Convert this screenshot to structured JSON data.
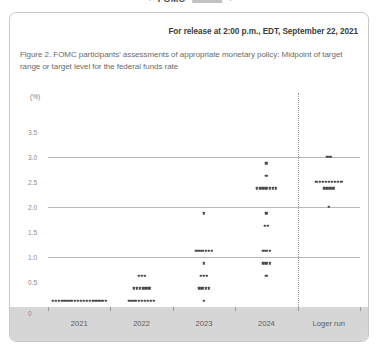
{
  "chrome": {
    "back_arrow": "‹",
    "forward_arrow": "›",
    "title": "FOMC"
  },
  "document": {
    "release_line": "For release at 2:00 p.m., EDT, September 22, 2021",
    "caption": "Figure 2. FOMC participants' assessments of appropriate monetary policy: Midpoint of target range or target level for the federal funds rate"
  },
  "chart_data": {
    "type": "scatter",
    "title": "Figure 2. FOMC participants' assessments of appropriate monetary policy: Midpoint of target range or target level for the federal funds rate",
    "xlabel": "",
    "ylabel": "(%)",
    "unit_label": "(%)",
    "ylim": [
      0,
      4.0
    ],
    "yticks": [
      "3.5",
      "3.0",
      "2.5",
      "2.0",
      "1.5",
      "1.0",
      "0.5",
      "0"
    ],
    "ytick_values": [
      3.5,
      3.0,
      2.5,
      2.0,
      1.5,
      1.0,
      0.5,
      0
    ],
    "gridlines_at": [
      3.0,
      2.0,
      1.0
    ],
    "grid": true,
    "legend": "none",
    "categories": [
      "2021",
      "2022",
      "2023",
      "2024",
      "Loger run"
    ],
    "divider_after_category": "2024",
    "series": [
      {
        "name": "2021",
        "clusters": [
          {
            "rate": 0.125,
            "count": 18
          }
        ]
      },
      {
        "name": "2022",
        "clusters": [
          {
            "rate": 0.625,
            "count": 3
          },
          {
            "rate": 0.375,
            "count": 6
          },
          {
            "rate": 0.125,
            "count": 9
          }
        ]
      },
      {
        "name": "2023",
        "clusters": [
          {
            "rate": 1.875,
            "count": 1
          },
          {
            "rate": 1.125,
            "count": 6
          },
          {
            "rate": 0.875,
            "count": 1
          },
          {
            "rate": 0.625,
            "count": 3
          },
          {
            "rate": 0.375,
            "count": 4
          },
          {
            "rate": 0.125,
            "count": 1
          }
        ]
      },
      {
        "name": "2024",
        "clusters": [
          {
            "rate": 2.875,
            "count": 1
          },
          {
            "rate": 2.625,
            "count": 1
          },
          {
            "rate": 2.375,
            "count": 7
          },
          {
            "rate": 1.875,
            "count": 1
          },
          {
            "rate": 1.625,
            "count": 2
          },
          {
            "rate": 1.125,
            "count": 3
          },
          {
            "rate": 0.875,
            "count": 3
          },
          {
            "rate": 0.625,
            "count": 1
          }
        ]
      },
      {
        "name": "Loger run",
        "clusters": [
          {
            "rate": 3.0,
            "count": 2
          },
          {
            "rate": 2.5,
            "count": 9
          },
          {
            "rate": 2.375,
            "count": 4
          },
          {
            "rate": 2.0,
            "count": 1
          }
        ]
      }
    ]
  },
  "colors": {
    "dot": "#4a4a4a",
    "gridline": "#b9b9b9",
    "band": "#d6d6d6",
    "card_border": "#c8c8c8",
    "text": "#6a6a6a"
  }
}
